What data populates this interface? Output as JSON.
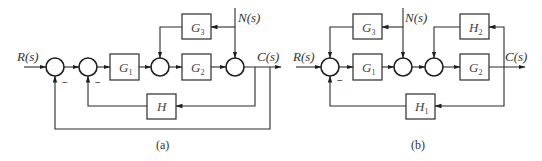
{
  "diagrams": [
    {
      "caption": "(a)",
      "input": "R(s)",
      "output": "C(s)",
      "disturbance": "N(s)",
      "blocks": {
        "g1": {
          "name": "G",
          "sub": "1"
        },
        "g2": {
          "name": "G",
          "sub": "2"
        },
        "g3": {
          "name": "G",
          "sub": "3"
        },
        "h": {
          "name": "H",
          "sub": ""
        }
      },
      "signs": {
        "sum1_bottom": "−",
        "sum2_bottom": "−"
      }
    },
    {
      "caption": "(b)",
      "input": "R(s)",
      "output": "C(s)",
      "disturbance": "N(s)",
      "blocks": {
        "g1": {
          "name": "G",
          "sub": "1"
        },
        "g2": {
          "name": "G",
          "sub": "2"
        },
        "g3": {
          "name": "G",
          "sub": "3"
        },
        "h1": {
          "name": "H",
          "sub": "1"
        },
        "h2": {
          "name": "H",
          "sub": "2"
        }
      },
      "signs": {
        "sum1_bottom": "−"
      }
    }
  ],
  "colors": {
    "line": "#2b2b2b",
    "background": "#ffffff"
  }
}
